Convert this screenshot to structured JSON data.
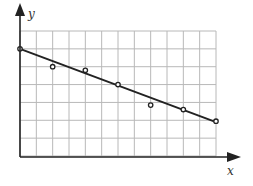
{
  "chart_data": {
    "type": "scatter",
    "title": "",
    "xlabel": "x",
    "ylabel": "y",
    "grid": true,
    "xlim": [
      0,
      12
    ],
    "ylim": [
      0,
      7
    ],
    "x": [
      0,
      2,
      4,
      6,
      8,
      10,
      12
    ],
    "series": [
      {
        "name": "data points",
        "values": [
          6.0,
          5.0,
          4.8,
          4.0,
          2.85,
          2.6,
          1.95
        ]
      },
      {
        "name": "best-fit line",
        "values": [
          6.0,
          5.25,
          4.5,
          3.75,
          3.0,
          2.25,
          1.9
        ]
      }
    ],
    "fit_line": {
      "x0": 0,
      "y0": 6.0,
      "x1": 12,
      "y1": 1.9
    },
    "legend": null
  },
  "labels": {
    "x_axis": "x",
    "y_axis": "y"
  },
  "colors": {
    "grid": "#b8b8b8",
    "axis": "#222222",
    "line": "#222222",
    "point": "#222222"
  }
}
